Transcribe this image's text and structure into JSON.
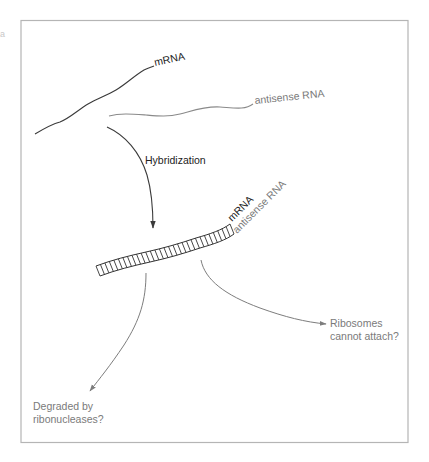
{
  "figure": {
    "corner_mark": "a",
    "colors": {
      "frame": "#b5b5b5",
      "mrna": "#3a3a3a",
      "antisense": "#8a8a8a",
      "outcome_text": "#7a7a7a"
    }
  },
  "labels": {
    "mrna_top": "mRNA",
    "antisense_top": "antisense RNA",
    "hybridization": "Hybridization",
    "mrna_hybrid": "mRNA",
    "antisense_hybrid": "antisense RNA",
    "outcome_ribosomes_line1": "Ribosomes",
    "outcome_ribosomes_line2": "cannot attach?",
    "outcome_degraded_line1": "Degraded by",
    "outcome_degraded_line2": "ribonucleases?"
  },
  "nodes": [
    {
      "id": "mrna",
      "label": "mRNA"
    },
    {
      "id": "antisense",
      "label": "antisense RNA"
    },
    {
      "id": "hybrid",
      "label": "mRNA / antisense RNA duplex"
    },
    {
      "id": "no-ribosome",
      "label": "Ribosomes cannot attach?"
    },
    {
      "id": "degraded",
      "label": "Degraded by ribonucleases?"
    }
  ],
  "edges": [
    {
      "from": "mrna",
      "to": "hybrid",
      "label": "Hybridization"
    },
    {
      "from": "antisense",
      "to": "hybrid",
      "label": "Hybridization"
    },
    {
      "from": "hybrid",
      "to": "no-ribosome",
      "label": ""
    },
    {
      "from": "hybrid",
      "to": "degraded",
      "label": ""
    }
  ]
}
